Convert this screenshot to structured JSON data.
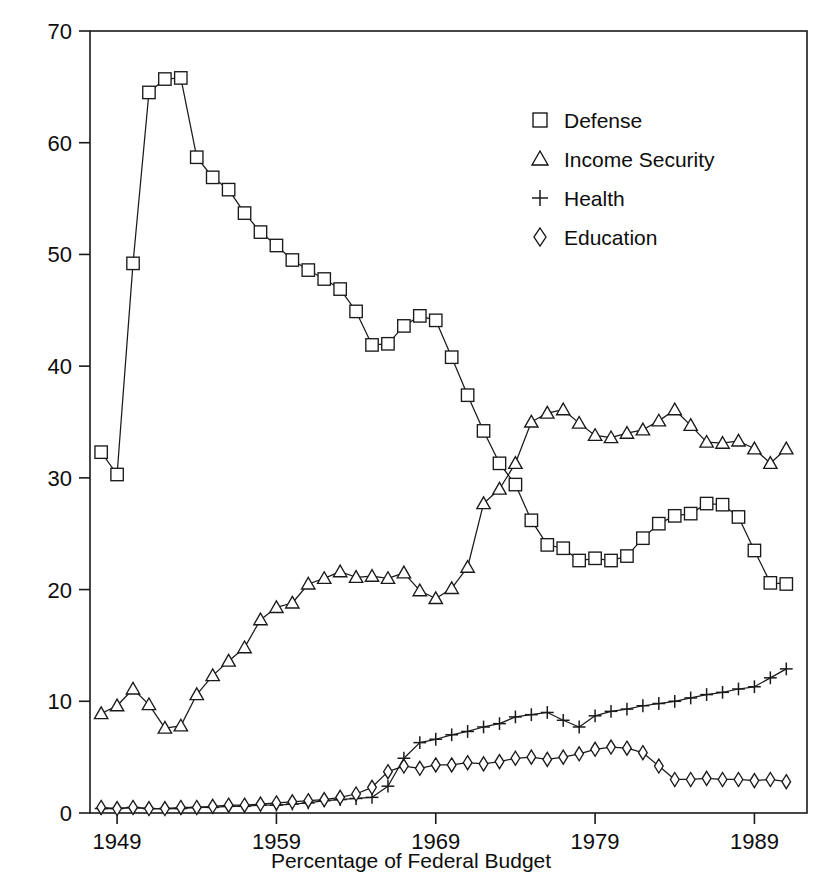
{
  "chart_data": {
    "type": "line",
    "title": "",
    "subtitle": "",
    "xlabel": "Percentage of Federal Budget",
    "ylabel": "",
    "xlim": [
      1947.3,
      1992.3
    ],
    "ylim": [
      0,
      70
    ],
    "grid": false,
    "legend_position": "top-right",
    "x_ticks": [
      1949,
      1959,
      1969,
      1979,
      1989
    ],
    "x_tick_labels": [
      "1949",
      "1959",
      "1969",
      "1979",
      "1989"
    ],
    "y_ticks": [
      0,
      10,
      20,
      30,
      40,
      50,
      60,
      70
    ],
    "y_tick_labels": [
      "0",
      "10",
      "20",
      "30",
      "40",
      "50",
      "60",
      "70"
    ],
    "x": [
      1948,
      1949,
      1950,
      1951,
      1952,
      1953,
      1954,
      1955,
      1956,
      1957,
      1958,
      1959,
      1960,
      1961,
      1962,
      1963,
      1964,
      1965,
      1966,
      1967,
      1968,
      1969,
      1970,
      1971,
      1972,
      1973,
      1974,
      1975,
      1976,
      1977,
      1978,
      1979,
      1980,
      1981,
      1982,
      1983,
      1984,
      1985,
      1986,
      1987,
      1988,
      1989,
      1990,
      1991
    ],
    "series": [
      {
        "name": "Defense",
        "marker": "square",
        "values": [
          32.3,
          30.3,
          49.2,
          64.5,
          65.7,
          65.8,
          58.7,
          56.9,
          55.8,
          53.7,
          52.0,
          50.8,
          49.5,
          48.6,
          47.8,
          46.9,
          44.9,
          41.9,
          42.0,
          43.6,
          44.5,
          44.1,
          40.8,
          37.4,
          34.2,
          31.3,
          29.4,
          26.2,
          24.0,
          23.7,
          22.6,
          22.8,
          22.6,
          23.0,
          24.6,
          25.9,
          26.6,
          26.8,
          27.7,
          27.6,
          26.5,
          23.5,
          20.6,
          20.5
        ]
      },
      {
        "name": "Income Security",
        "marker": "triangle",
        "values": [
          8.9,
          9.6,
          11.1,
          9.7,
          7.6,
          7.8,
          10.6,
          12.3,
          13.6,
          14.8,
          17.3,
          18.4,
          18.8,
          20.5,
          21.0,
          21.6,
          21.1,
          21.2,
          21.0,
          21.5,
          19.9,
          19.2,
          20.1,
          22.0,
          27.7,
          29.0,
          31.3,
          35.0,
          35.8,
          36.1,
          34.9,
          33.8,
          33.6,
          34.0,
          34.3,
          35.1,
          36.1,
          34.7,
          33.2,
          33.1,
          33.3,
          32.6,
          31.3,
          32.6
        ]
      },
      {
        "name": "Health",
        "marker": "plus",
        "values": [
          0.4,
          0.4,
          0.5,
          0.4,
          0.4,
          0.4,
          0.5,
          0.5,
          0.6,
          0.6,
          0.7,
          0.7,
          0.8,
          0.9,
          1.1,
          1.2,
          1.3,
          1.4,
          2.4,
          4.9,
          6.3,
          6.6,
          7.0,
          7.3,
          7.7,
          8.0,
          8.6,
          8.8,
          9.0,
          8.3,
          7.7,
          8.7,
          9.1,
          9.3,
          9.6,
          9.8,
          10.0,
          10.3,
          10.6,
          10.8,
          11.1,
          11.3,
          12.1,
          12.9
        ]
      },
      {
        "name": "Education",
        "marker": "diamond",
        "values": [
          0.5,
          0.4,
          0.5,
          0.4,
          0.4,
          0.5,
          0.5,
          0.6,
          0.7,
          0.7,
          0.8,
          0.9,
          1.0,
          1.1,
          1.2,
          1.4,
          1.7,
          2.3,
          3.7,
          4.2,
          4.0,
          4.3,
          4.3,
          4.5,
          4.4,
          4.6,
          4.9,
          5.0,
          4.8,
          5.0,
          5.3,
          5.7,
          5.9,
          5.8,
          5.4,
          4.2,
          3.0,
          3.0,
          3.1,
          3.0,
          3.0,
          2.9,
          3.0,
          2.8
        ]
      }
    ],
    "legend_entries": [
      {
        "label": "Defense",
        "marker": "square"
      },
      {
        "label": "Income Security",
        "marker": "triangle"
      },
      {
        "label": "Health",
        "marker": "plus"
      },
      {
        "label": "Education",
        "marker": "diamond"
      }
    ]
  }
}
